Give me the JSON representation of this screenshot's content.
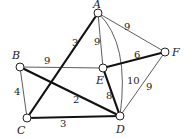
{
  "graph": {
    "nodes": [
      {
        "id": "A",
        "label": "A",
        "x": 98,
        "y": 13,
        "label_x": 93,
        "label_y": 8
      },
      {
        "id": "B",
        "label": "B",
        "x": 20,
        "y": 67,
        "label_x": 12,
        "label_y": 59
      },
      {
        "id": "C",
        "label": "C",
        "x": 27,
        "y": 118,
        "label_x": 17,
        "label_y": 134
      },
      {
        "id": "D",
        "label": "D",
        "x": 120,
        "y": 116,
        "label_x": 116,
        "label_y": 133
      },
      {
        "id": "E",
        "label": "E",
        "x": 103,
        "y": 68,
        "label_x": 96,
        "label_y": 84
      },
      {
        "id": "F",
        "label": "F",
        "x": 165,
        "y": 52,
        "label_x": 172,
        "label_y": 56
      }
    ],
    "edges": [
      {
        "from": "A",
        "to": "C",
        "weight": "3",
        "bold": true,
        "label_x": 72,
        "label_y": 46
      },
      {
        "from": "A",
        "to": "E",
        "weight": "9",
        "bold": false,
        "label_x": 94,
        "label_y": 45
      },
      {
        "from": "A",
        "to": "F",
        "weight": "9",
        "bold": false,
        "label_x": 124,
        "label_y": 30
      },
      {
        "from": "A",
        "to": "D",
        "weight": "10",
        "bold": false,
        "curved": true,
        "label_x": 127,
        "label_y": 84
      },
      {
        "from": "B",
        "to": "E",
        "weight": "9",
        "bold": false,
        "label_x": 44,
        "label_y": 64
      },
      {
        "from": "B",
        "to": "C",
        "weight": "4",
        "bold": false,
        "label_x": 14,
        "label_y": 95
      },
      {
        "from": "B",
        "to": "D",
        "weight": "2",
        "bold": true,
        "label_x": 73,
        "label_y": 103
      },
      {
        "from": "C",
        "to": "D",
        "weight": "3",
        "bold": true,
        "label_x": 60,
        "label_y": 127
      },
      {
        "from": "E",
        "to": "D",
        "weight": "8",
        "bold": true,
        "label_x": 106,
        "label_y": 99
      },
      {
        "from": "E",
        "to": "F",
        "weight": "6",
        "bold": true,
        "label_x": 134,
        "label_y": 58
      },
      {
        "from": "F",
        "to": "D",
        "weight": "9",
        "bold": false,
        "label_x": 146,
        "label_y": 90
      }
    ]
  }
}
